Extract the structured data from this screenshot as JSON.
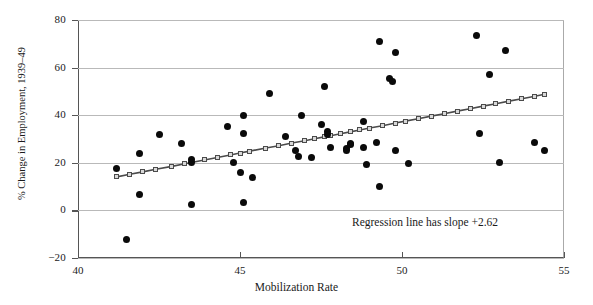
{
  "chart_data": {
    "type": "scatter",
    "title": "",
    "xlabel": "Mobilization Rate",
    "ylabel": "% Change in Employment, 1939–49",
    "xlim": [
      40,
      55
    ],
    "ylim": [
      -20,
      80
    ],
    "xticks": [
      40,
      45,
      50,
      55
    ],
    "yticks": [
      -20,
      0,
      20,
      40,
      60,
      80
    ],
    "xtick_labels": [
      "40",
      "45",
      "50",
      "55"
    ],
    "ytick_labels": [
      "−20",
      "0",
      "20",
      "40",
      "60",
      "80"
    ],
    "grid": "horizontal",
    "legend": "none",
    "annotations": [
      {
        "text": "Regression line has slope +2.62",
        "x": 51.2,
        "y": -9.5
      }
    ],
    "series": [
      {
        "name": "states",
        "type": "scatter",
        "marker": "filled-circle",
        "color": "#0a0a0a",
        "points": [
          [
            41.2,
            17.5
          ],
          [
            41.5,
            -12.3
          ],
          [
            41.9,
            24.0
          ],
          [
            41.9,
            6.8
          ],
          [
            42.5,
            32.0
          ],
          [
            43.2,
            28.0
          ],
          [
            43.5,
            21.5
          ],
          [
            43.5,
            20.0
          ],
          [
            43.5,
            2.5
          ],
          [
            44.6,
            35.3
          ],
          [
            44.8,
            20.0
          ],
          [
            45.0,
            15.8
          ],
          [
            45.1,
            40.0
          ],
          [
            45.1,
            32.5
          ],
          [
            45.1,
            3.2
          ],
          [
            45.4,
            13.8
          ],
          [
            45.9,
            49.3
          ],
          [
            46.4,
            31.2
          ],
          [
            46.7,
            25.0
          ],
          [
            46.8,
            22.8
          ],
          [
            46.9,
            40.0
          ],
          [
            47.2,
            22.3
          ],
          [
            47.5,
            36.0
          ],
          [
            47.6,
            52.0
          ],
          [
            47.7,
            33.3
          ],
          [
            47.7,
            32.0
          ],
          [
            47.8,
            26.5
          ],
          [
            48.3,
            26.2
          ],
          [
            48.3,
            25.2
          ],
          [
            48.4,
            27.5
          ],
          [
            48.4,
            28.0
          ],
          [
            48.8,
            37.3
          ],
          [
            48.8,
            26.5
          ],
          [
            48.9,
            19.2
          ],
          [
            49.2,
            28.7
          ],
          [
            49.3,
            70.8
          ],
          [
            49.3,
            10.2
          ],
          [
            49.6,
            55.5
          ],
          [
            49.7,
            54.0
          ],
          [
            49.8,
            66.2
          ],
          [
            49.8,
            25.0
          ],
          [
            50.2,
            19.5
          ],
          [
            52.3,
            73.6
          ],
          [
            52.4,
            32.5
          ],
          [
            52.7,
            57.3
          ],
          [
            53.0,
            20.2
          ],
          [
            53.2,
            67.0
          ],
          [
            54.1,
            28.5
          ],
          [
            54.4,
            25.2
          ]
        ]
      },
      {
        "name": "regression-line",
        "type": "line",
        "marker": "open-square",
        "color": "#4b4b4b",
        "slope": 2.62,
        "points": [
          [
            41.2,
            14.1
          ],
          [
            41.6,
            15.2
          ],
          [
            42.0,
            16.2
          ],
          [
            42.4,
            17.3
          ],
          [
            42.9,
            18.5
          ],
          [
            43.3,
            19.6
          ],
          [
            43.5,
            20.1
          ],
          [
            43.9,
            21.2
          ],
          [
            44.3,
            22.2
          ],
          [
            44.7,
            23.3
          ],
          [
            45.0,
            24.1
          ],
          [
            45.3,
            24.9
          ],
          [
            45.8,
            26.2
          ],
          [
            46.2,
            27.2
          ],
          [
            46.6,
            28.3
          ],
          [
            47.0,
            29.3
          ],
          [
            47.3,
            30.1
          ],
          [
            47.6,
            30.9
          ],
          [
            47.8,
            31.4
          ],
          [
            48.1,
            32.2
          ],
          [
            48.4,
            33.0
          ],
          [
            48.7,
            33.8
          ],
          [
            49.0,
            34.6
          ],
          [
            49.4,
            35.6
          ],
          [
            49.8,
            36.7
          ],
          [
            50.1,
            37.5
          ],
          [
            50.5,
            38.5
          ],
          [
            50.9,
            39.6
          ],
          [
            51.3,
            40.6
          ],
          [
            51.7,
            41.7
          ],
          [
            52.1,
            42.7
          ],
          [
            52.5,
            43.8
          ],
          [
            52.9,
            44.8
          ],
          [
            53.3,
            45.9
          ],
          [
            53.7,
            46.9
          ],
          [
            54.1,
            48.0
          ],
          [
            54.4,
            48.8
          ]
        ]
      }
    ]
  },
  "axes": {
    "x_title": "Mobilization Rate",
    "y_title": "% Change in Employment, 1939–49"
  },
  "annotation": {
    "text": "Regression line has slope +2.62"
  },
  "colors": {
    "point": "#0a0a0a",
    "line": "#4b4b4b",
    "grid": "#b9b9b9",
    "axis": "#555555",
    "background": "#ffffff"
  }
}
